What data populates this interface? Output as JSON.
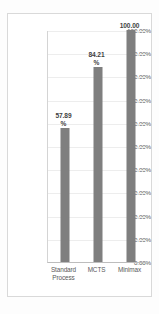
{
  "chart_data": {
    "type": "bar",
    "title": "",
    "xlabel": "",
    "ylabel": "",
    "categories": [
      "Standard Process",
      "MCTS",
      "Minimax"
    ],
    "values": [
      57.89,
      84.21,
      100.0
    ],
    "value_labels": [
      "57.89",
      "84.21",
      "100.00"
    ],
    "value_units": [
      "%",
      "%",
      ""
    ],
    "ylim": [
      0,
      100
    ],
    "ytick_step": 10,
    "ytick_labels": [
      "100.00%",
      "90.00%",
      "80.00%",
      "70.00%",
      "60.00%",
      "50.00%",
      "40.00%",
      "30.00%",
      "20.00%",
      "10.00%",
      "0.00%"
    ],
    "ytick_values": [
      100,
      90,
      80,
      70,
      60,
      50,
      40,
      30,
      20,
      10,
      0
    ],
    "category_label_lines": [
      [
        "Standard",
        "Process"
      ],
      [
        "MCTS"
      ],
      [
        "Minimax"
      ]
    ],
    "grid": "horizontal",
    "legend": "none",
    "colors": {
      "bar": "#7f7f7f",
      "gridline": "#ededed",
      "axis": "#bdbdbd",
      "frame": "#d9d9d9",
      "tick_text": "#595959",
      "data_label_text": "#3f3f3f",
      "background": "#ffffff"
    }
  }
}
